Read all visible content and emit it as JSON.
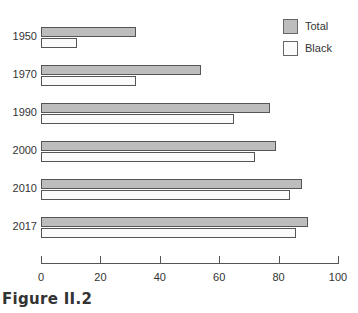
{
  "chart_data": {
    "type": "bar",
    "orientation": "horizontal",
    "title": "",
    "caption": "Figure II.2",
    "xlabel": "",
    "ylabel": "",
    "categories": [
      "1950",
      "1970",
      "1990",
      "2000",
      "2010",
      "2017"
    ],
    "series": [
      {
        "name": "Total",
        "color": "#bdbdbd",
        "values": [
          32,
          54,
          77,
          79,
          88,
          90
        ]
      },
      {
        "name": "Black",
        "color": "#fbfbfb",
        "values": [
          12,
          32,
          65,
          72,
          84,
          86
        ]
      }
    ],
    "xlim": [
      0,
      100
    ],
    "xticks": [
      "0",
      "20",
      "40",
      "60",
      "80",
      "100"
    ],
    "grid": false,
    "legend_position": "top-right"
  },
  "legend": {
    "total": "Total",
    "black": "Black"
  },
  "caption": "Figure II.2"
}
